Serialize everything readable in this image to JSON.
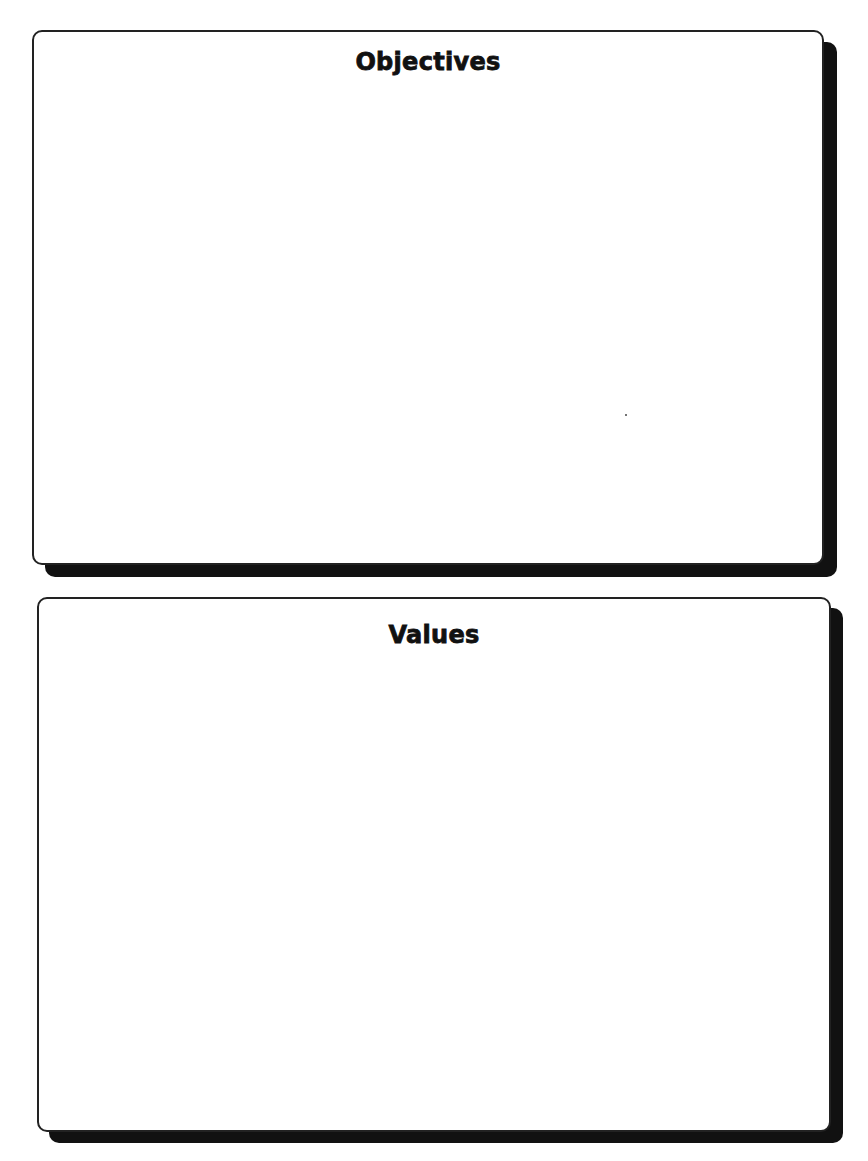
{
  "page": {
    "background": "#ffffff",
    "ink_color": "#111111"
  },
  "boxes": [
    {
      "id": "objectives",
      "title": "Objectives",
      "content": ""
    },
    {
      "id": "values",
      "title": "Values",
      "content": ""
    }
  ]
}
